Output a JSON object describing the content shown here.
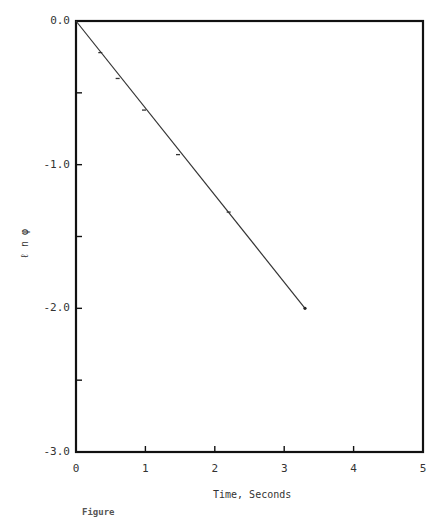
{
  "chart_data": {
    "type": "line",
    "title": "",
    "xlabel": "Time, Seconds",
    "ylabel": "ℓn φ",
    "xlim": [
      0,
      5
    ],
    "ylim": [
      -3.0,
      0.0
    ],
    "grid": false,
    "legend": null,
    "x_ticks": [
      "0",
      "1",
      "2",
      "3",
      "4",
      "5"
    ],
    "y_ticks": [
      "0.0",
      "-1.0",
      "-2.0",
      "-3.0"
    ],
    "y_minor_ticks": [
      -0.5,
      -1.5,
      -2.5
    ],
    "series": [
      {
        "name": "ln phi vs time (fit)",
        "style": "line",
        "x": [
          0.0,
          3.3
        ],
        "y": [
          0.0,
          -2.0
        ]
      },
      {
        "name": "measured points",
        "style": "markers",
        "x": [
          0.35,
          0.6,
          0.98,
          1.47,
          2.2
        ],
        "y": [
          -0.22,
          -0.4,
          -0.62,
          -0.93,
          -1.33
        ]
      }
    ],
    "caption": "Figure"
  },
  "labels": {
    "x_axis_title": "Time, Seconds",
    "y_axis_title": "ℓ n φ",
    "caption": "Figure"
  }
}
